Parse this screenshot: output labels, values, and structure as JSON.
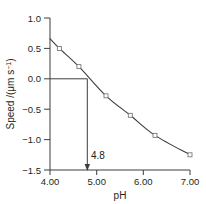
{
  "figure": {
    "name": "electrophoretic-mobility-vs-ph",
    "background": "#ffffff",
    "ink_color": "#3d3d3d",
    "text_color": "#231f20"
  },
  "chart_data": {
    "type": "line",
    "title": "",
    "xlabel": "pH",
    "ylabel": "Speed /(μm s⁻¹)",
    "xlim": [
      4.0,
      7.0
    ],
    "ylim": [
      -1.5,
      1.0
    ],
    "grid": false,
    "legend": null,
    "xticks": [
      4.0,
      5.0,
      6.0,
      7.0
    ],
    "xticklabels": [
      "4.00",
      "5.00",
      "6.00",
      "7.00"
    ],
    "yticks": [
      1.0,
      0.5,
      0.0,
      -0.5,
      -1.0,
      -1.5
    ],
    "yticklabels": [
      "1.0",
      "0.5",
      "0.0",
      "−0.5",
      "−1.0",
      "−1.5"
    ],
    "series": [
      {
        "name": "speed",
        "marker": "open-square",
        "x": [
          4.0,
          4.2,
          4.62,
          5.2,
          5.72,
          6.25,
          7.0
        ],
        "y": [
          0.66,
          0.5,
          0.2,
          -0.28,
          -0.6,
          -0.93,
          -1.25
        ]
      }
    ],
    "annotations": [
      {
        "name": "isoelectric-point",
        "label": "4.8",
        "x": 4.8,
        "y": 0.0,
        "type": "arrow-down-to-axis",
        "guide_from_y_axis": true
      }
    ]
  },
  "labels": {
    "x_axis_title": "pH",
    "y_axis_title": "Speed /(μm s⁻¹)",
    "y_axis_title_main": "Speed /(μm s",
    "y_axis_title_exponent": "−1",
    "y_axis_title_close": ")",
    "annotation_value": "4.8",
    "xtick_0": "4.00",
    "xtick_1": "5.00",
    "xtick_2": "6.00",
    "xtick_3": "7.00",
    "ytick_0": "1.0",
    "ytick_1": "0.5",
    "ytick_2": "0.0",
    "ytick_3": "−0.5",
    "ytick_4": "−1.0",
    "ytick_5": "−1.5"
  }
}
